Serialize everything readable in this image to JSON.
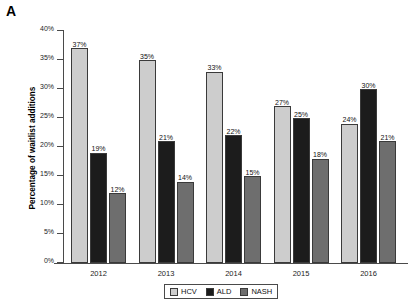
{
  "panel": {
    "letter": "A"
  },
  "chart_data": {
    "type": "bar",
    "title": "",
    "xlabel": "",
    "ylabel": "Percentage of waitlist additions",
    "categories": [
      "2012",
      "2013",
      "2014",
      "2015",
      "2016"
    ],
    "series": [
      {
        "name": "HCV",
        "color": "#cdcdcd",
        "values": [
          37,
          35,
          33,
          27,
          24
        ],
        "labels": [
          "37%",
          "35%",
          "33%",
          "27%",
          "24%"
        ]
      },
      {
        "name": "ALD",
        "color": "#1c1c1c",
        "values": [
          19,
          21,
          22,
          25,
          30
        ],
        "labels": [
          "19%",
          "21%",
          "22%",
          "25%",
          "30%"
        ]
      },
      {
        "name": "NASH",
        "color": "#6e6e6e",
        "values": [
          12,
          14,
          15,
          18,
          21
        ],
        "labels": [
          "12%",
          "14%",
          "15%",
          "18%",
          "21%"
        ]
      }
    ],
    "ylim": [
      0,
      40
    ],
    "yticks": [
      0,
      5,
      10,
      15,
      20,
      25,
      30,
      35,
      40
    ],
    "ytick_labels": [
      "0%",
      "5%",
      "10%",
      "15%",
      "20%",
      "25%",
      "30%",
      "35%",
      "40%"
    ],
    "grid": false,
    "legend_position": "bottom-center",
    "value_labels": true
  }
}
